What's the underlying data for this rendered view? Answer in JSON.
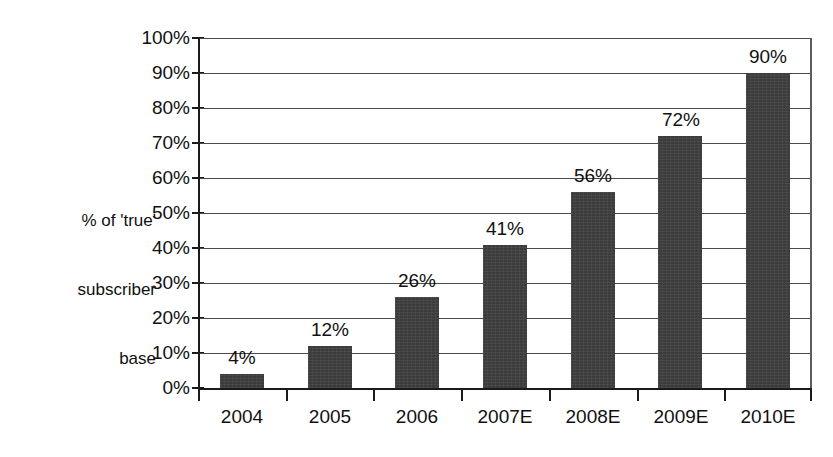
{
  "chart_data": {
    "type": "bar",
    "title": "",
    "xlabel": "",
    "ylabel": "% of 'true' subscriber base",
    "ylabel_lines": [
      "% of 'true'",
      "subscriber",
      "base"
    ],
    "categories": [
      "2004",
      "2005",
      "2006",
      "2007E",
      "2008E",
      "2009E",
      "2010E"
    ],
    "values": [
      4,
      12,
      26,
      41,
      56,
      72,
      90
    ],
    "value_labels": [
      "4%",
      "12%",
      "26%",
      "41%",
      "56%",
      "72%",
      "90%"
    ],
    "ylim": [
      0,
      100
    ],
    "ytick_values": [
      0,
      10,
      20,
      30,
      40,
      50,
      60,
      70,
      80,
      90,
      100
    ],
    "ytick_labels": [
      "0%",
      "10%",
      "20%",
      "30%",
      "40%",
      "50%",
      "60%",
      "70%",
      "80%",
      "90%",
      "100%"
    ],
    "grid": true,
    "legend": false,
    "legend_position": "none",
    "series": [
      {
        "name": "% of 'true' subscriber base",
        "values": [
          4,
          12,
          26,
          41,
          56,
          72,
          90
        ],
        "color": "#3c3c3c"
      }
    ],
    "colors": {
      "bar": "#3c3c3c",
      "gridline": "#4a4a4a",
      "axis": "#1a1a1a",
      "text": "#111111",
      "background": "#ffffff"
    }
  }
}
